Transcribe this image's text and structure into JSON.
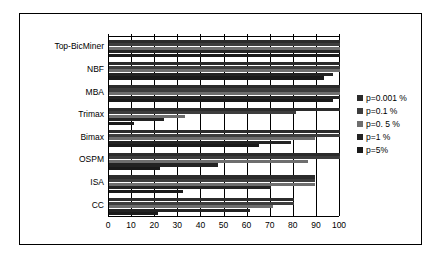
{
  "chart_data": {
    "type": "bar",
    "orientation": "horizontal",
    "title": "",
    "xlabel": "",
    "ylabel": "",
    "xlim": [
      0,
      100
    ],
    "xticks": [
      0,
      10,
      20,
      30,
      40,
      50,
      60,
      70,
      80,
      90,
      100
    ],
    "grid": true,
    "legend_position": "right",
    "categories": [
      "Top-BicMiner",
      "NBF",
      "MBA",
      "Trimax",
      "Bimax",
      "OSPM",
      "ISA",
      "CC"
    ],
    "series": [
      {
        "name": "p=0.001 %",
        "color": "#2b2b2b",
        "values": [
          100,
          100,
          100,
          100,
          100,
          100,
          89,
          80
        ]
      },
      {
        "name": "p=0.1 %",
        "color": "#3d3d3d",
        "values": [
          100,
          100,
          100,
          81,
          100,
          100,
          89,
          80
        ]
      },
      {
        "name": "p=0. 5 %",
        "color": "#6e6e6e",
        "values": [
          100,
          100,
          100,
          33,
          89,
          86,
          89,
          71
        ]
      },
      {
        "name": "p=1 %",
        "color": "#232323",
        "values": [
          100,
          97,
          100,
          24,
          79,
          47,
          70,
          61
        ]
      },
      {
        "name": "p=5%",
        "color": "#1a1a1a",
        "values": [
          100,
          93,
          97,
          11,
          65,
          22,
          32,
          21
        ]
      }
    ]
  },
  "legend": {
    "items": [
      {
        "label": "p=0.001 %",
        "color": "#2b2b2b"
      },
      {
        "label": "p=0.1 %",
        "color": "#3d3d3d"
      },
      {
        "label": "p=0. 5 %",
        "color": "#6e6e6e"
      },
      {
        "label": "p=1 %",
        "color": "#232323"
      },
      {
        "label": "p=5%",
        "color": "#1a1a1a"
      }
    ]
  },
  "axis": {
    "x_tick_labels": [
      "0",
      "10",
      "20",
      "30",
      "40",
      "50",
      "60",
      "70",
      "80",
      "90",
      "100"
    ]
  }
}
